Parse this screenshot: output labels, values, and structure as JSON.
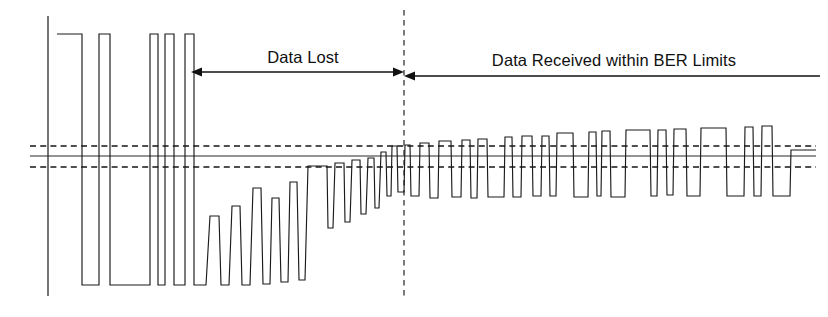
{
  "figure": {
    "background_color": "#ffffff",
    "ink_color": "#111111",
    "width": 828,
    "height": 317
  },
  "annotations": {
    "data_lost_label": "Data Lost",
    "data_received_label": "Data Received within BER Limits"
  },
  "chart_data": {
    "type": "line",
    "subtitle": "",
    "xlabel": "",
    "ylabel": "",
    "grid": false,
    "legend_position": "none",
    "xlim": [
      0,
      828
    ],
    "ylim": [
      0,
      317
    ],
    "reference_lines": [
      {
        "name": "upper-threshold",
        "orientation": "horizontal",
        "y": 146,
        "style": "dashed",
        "x_start": 30,
        "x_end": 816
      },
      {
        "name": "center-level",
        "orientation": "horizontal",
        "y": 156,
        "style": "solid",
        "x_start": 30,
        "x_end": 816
      },
      {
        "name": "lower-threshold",
        "orientation": "horizontal",
        "y": 167,
        "style": "dashed",
        "x_start": 30,
        "x_end": 816
      },
      {
        "name": "left-axis",
        "orientation": "vertical",
        "x": 48,
        "style": "solid",
        "y_start": 16,
        "y_end": 296
      },
      {
        "name": "region-divider",
        "orientation": "vertical",
        "x": 404,
        "style": "dashed",
        "y_start": 10,
        "y_end": 297
      }
    ],
    "arrows": [
      {
        "name": "data-lost-arrow",
        "label": "Data Lost",
        "y": 72,
        "x_start": 191,
        "x_end": 404,
        "head_start": true,
        "head_end": true,
        "label_x": 303,
        "label_y": 63
      },
      {
        "name": "data-received-arrow",
        "label": "Data Received within BER Limits",
        "y": 76,
        "x_start": 404,
        "x_end": 820,
        "head_start": true,
        "head_end": false,
        "label_x": 614,
        "label_y": 66
      }
    ],
    "waveform": {
      "name": "degrading-digital-signal",
      "stroke_color": "#1b1b1b",
      "points": [
        [
          57,
          34
        ],
        [
          82,
          34
        ],
        [
          82,
          285
        ],
        [
          99,
          285
        ],
        [
          99,
          34
        ],
        [
          110,
          34
        ],
        [
          110,
          285
        ],
        [
          150,
          285
        ],
        [
          150,
          34
        ],
        [
          158,
          34
        ],
        [
          158,
          285
        ],
        [
          165,
          285
        ],
        [
          165,
          34
        ],
        [
          174,
          34
        ],
        [
          174,
          285
        ],
        [
          185,
          285
        ],
        [
          185,
          34
        ],
        [
          194,
          34
        ],
        [
          194,
          285
        ],
        [
          206,
          285
        ],
        [
          210,
          216
        ],
        [
          219,
          216
        ],
        [
          221,
          285
        ],
        [
          229,
          285
        ],
        [
          232,
          206
        ],
        [
          240,
          206
        ],
        [
          242,
          285
        ],
        [
          250,
          285
        ],
        [
          253,
          188
        ],
        [
          261,
          188
        ],
        [
          263,
          284
        ],
        [
          270,
          284
        ],
        [
          272,
          198
        ],
        [
          279,
          198
        ],
        [
          281,
          282
        ],
        [
          288,
          282
        ],
        [
          290,
          182
        ],
        [
          297,
          182
        ],
        [
          299,
          280
        ],
        [
          305,
          280
        ],
        [
          308,
          166
        ],
        [
          327,
          166
        ],
        [
          328,
          228
        ],
        [
          333,
          228
        ],
        [
          335,
          163
        ],
        [
          344,
          163
        ],
        [
          345,
          222
        ],
        [
          350,
          222
        ],
        [
          352,
          160
        ],
        [
          360,
          160
        ],
        [
          361,
          214
        ],
        [
          366,
          214
        ],
        [
          368,
          158
        ],
        [
          374,
          158
        ],
        [
          375,
          208
        ],
        [
          379,
          208
        ],
        [
          381,
          152
        ],
        [
          386,
          152
        ],
        [
          387,
          196
        ],
        [
          391,
          196
        ],
        [
          392,
          146
        ],
        [
          397,
          146
        ],
        [
          398,
          192
        ],
        [
          404,
          192
        ],
        [
          405,
          145
        ],
        [
          410,
          145
        ],
        [
          411,
          196
        ],
        [
          419,
          196
        ],
        [
          420,
          143
        ],
        [
          429,
          143
        ],
        [
          430,
          198
        ],
        [
          438,
          198
        ],
        [
          439,
          141
        ],
        [
          451,
          141
        ],
        [
          452,
          197
        ],
        [
          461,
          197
        ],
        [
          462,
          140
        ],
        [
          470,
          140
        ],
        [
          471,
          198
        ],
        [
          477,
          198
        ],
        [
          478,
          139
        ],
        [
          487,
          139
        ],
        [
          488,
          197
        ],
        [
          504,
          197
        ],
        [
          505,
          137
        ],
        [
          512,
          137
        ],
        [
          513,
          197
        ],
        [
          521,
          197
        ],
        [
          522,
          136
        ],
        [
          532,
          136
        ],
        [
          533,
          196
        ],
        [
          541,
          196
        ],
        [
          542,
          136
        ],
        [
          549,
          136
        ],
        [
          550,
          196
        ],
        [
          556,
          196
        ],
        [
          557,
          133
        ],
        [
          573,
          133
        ],
        [
          574,
          197
        ],
        [
          588,
          197
        ],
        [
          589,
          132
        ],
        [
          596,
          132
        ],
        [
          597,
          196
        ],
        [
          601,
          196
        ],
        [
          602,
          131
        ],
        [
          610,
          131
        ],
        [
          611,
          197
        ],
        [
          625,
          197
        ],
        [
          626,
          130
        ],
        [
          650,
          130
        ],
        [
          651,
          196
        ],
        [
          657,
          196
        ],
        [
          658,
          130
        ],
        [
          666,
          130
        ],
        [
          667,
          195
        ],
        [
          673,
          195
        ],
        [
          674,
          129
        ],
        [
          686,
          129
        ],
        [
          687,
          196
        ],
        [
          700,
          196
        ],
        [
          701,
          128
        ],
        [
          726,
          128
        ],
        [
          727,
          196
        ],
        [
          744,
          196
        ],
        [
          745,
          127
        ],
        [
          753,
          127
        ],
        [
          754,
          196
        ],
        [
          761,
          196
        ],
        [
          762,
          126
        ],
        [
          772,
          126
        ],
        [
          773,
          196
        ],
        [
          790,
          196
        ],
        [
          791,
          150
        ],
        [
          816,
          150
        ]
      ]
    }
  }
}
